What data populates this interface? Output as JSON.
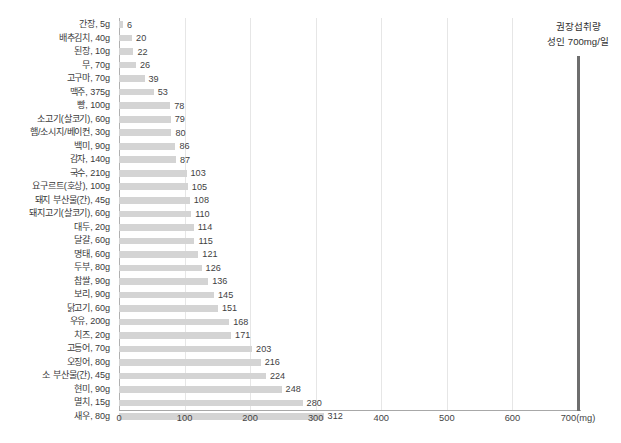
{
  "chart_data": {
    "type": "bar",
    "orientation": "horizontal",
    "title": "",
    "subtitle": "",
    "xlabel": "",
    "ylabel": "",
    "xlim": [
      0,
      700
    ],
    "grid": true,
    "gridlines_at": [
      100,
      200,
      300,
      400,
      500,
      600
    ],
    "legend_position": "none",
    "x_tick_labels": [
      "0",
      "100",
      "200",
      "300",
      "400",
      "500",
      "600",
      "700(mg)"
    ],
    "x_ticks": [
      0,
      100,
      200,
      300,
      400,
      500,
      600,
      700
    ],
    "bar_color": "#d4d4d4",
    "categories": [
      "간장, 5g",
      "배추김치, 40g",
      "된장, 10g",
      "무, 70g",
      "고구마, 70g",
      "맥주, 375g",
      "빵, 100g",
      "소고기(살코기), 60g",
      "햄/소시지/베이컨, 30g",
      "백미, 90g",
      "감자, 140g",
      "국수, 210g",
      "요구르트(호상), 100g",
      "돼지 부산물(간), 45g",
      "돼지고기(살코기), 60g",
      "대두, 20g",
      "달걀, 60g",
      "명태, 60g",
      "두부, 80g",
      "찹쌀, 90g",
      "보리, 90g",
      "닭고기, 60g",
      "우유, 200g",
      "치즈, 20g",
      "고등어, 70g",
      "오징어, 80g",
      "소 부산물(간), 45g",
      "현미, 90g",
      "멸치, 15g",
      "새우, 80g"
    ],
    "values": [
      6,
      20,
      22,
      26,
      39,
      53,
      78,
      79,
      80,
      86,
      87,
      103,
      105,
      108,
      110,
      114,
      115,
      121,
      126,
      136,
      145,
      151,
      168,
      171,
      203,
      216,
      224,
      248,
      280,
      312
    ],
    "value_labels": [
      "6",
      "20",
      "22",
      "26",
      "39",
      "53",
      "78",
      "79",
      "80",
      "86",
      "87",
      "103",
      "105",
      "108",
      "110",
      "114",
      "115",
      "121",
      "126",
      "136",
      "145",
      "151",
      "168",
      "171",
      "203",
      "216",
      "224",
      "248",
      "280",
      "312"
    ],
    "annotations": [
      {
        "name": "recommended-intake-reference",
        "line1": "권장섭취량",
        "line2": "성인 700mg/일",
        "value": 700,
        "color": "#6e6e6e"
      }
    ]
  },
  "reference": {
    "line1": "권장섭취량",
    "line2": "성인 700mg/일"
  }
}
